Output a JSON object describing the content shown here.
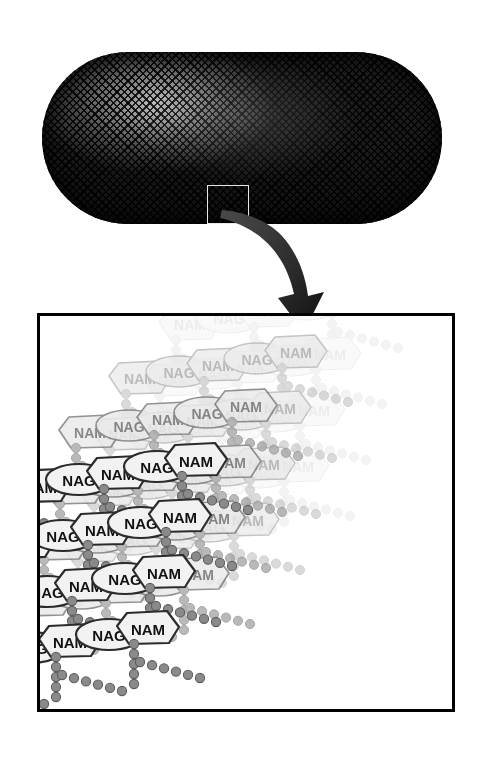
{
  "figure": {
    "cell": {
      "name": "rod-shaped bacterium",
      "callout_label": "",
      "surface_texture": "cross-hatch mesh"
    },
    "arrow": {
      "name": "magnification-arrow",
      "direction": "down-right"
    },
    "panel": {
      "name": "peptidoglycan-detail",
      "border_color": "#000000",
      "background": "#ffffff"
    }
  },
  "labels": {
    "nam": "NAM",
    "nag": "NAG"
  },
  "colors": {
    "outline_front": "#2b2b2b",
    "fill_front": "#f2f2f2",
    "bead_front": "#8a8a8a",
    "bead_front_outline": "#5e5e5e",
    "mid_outline": "#9a9a9a",
    "mid_fill": "#e4e4e4",
    "mid_text": "#8d8d8d",
    "back_outline": "#c9c9c9",
    "back_fill": "#eeeeee",
    "back_text": "#c2c2c2",
    "cell_dark": "#151515",
    "panel_border": "#000000"
  },
  "chart_data": {
    "type": "diagram",
    "subunits": [
      "NAM",
      "NAG"
    ],
    "layers": [
      {
        "name": "back",
        "opacity": 0.3,
        "offset_x": 150,
        "offset_y": 8,
        "rows": 4,
        "cols": 5
      },
      {
        "name": "middle",
        "opacity": 0.58,
        "offset_x": 100,
        "offset_y": 62,
        "rows": 4,
        "cols": 5
      },
      {
        "name": "near",
        "opacity": 0.8,
        "offset_x": 50,
        "offset_y": 116,
        "rows": 4,
        "cols": 5
      },
      {
        "name": "front",
        "opacity": 1.0,
        "offset_x": 0,
        "offset_y": 170,
        "rows": 4,
        "cols": 5
      }
    ],
    "row_spacing": 56,
    "col_spacing": 78,
    "strand_slope": -13,
    "peptide_chain": {
      "bead_count": 5,
      "bead_radius": 4.6,
      "orientation": "vertical-then-horizontal"
    }
  }
}
